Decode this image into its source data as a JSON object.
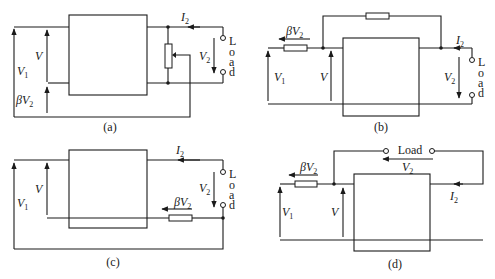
{
  "figure": {
    "panels": [
      {
        "id": "a",
        "caption": "(a)",
        "labels": {
          "I2": "I",
          "I2_sub": "2",
          "V": "V",
          "V1": "V",
          "V1_sub": "1",
          "V2": "V",
          "V2_sub": "2",
          "beta": "β",
          "betaV": "V",
          "betaV_sub": "2"
        },
        "load": [
          "L",
          "o",
          "a",
          "d"
        ],
        "description": "Amplifier with potentiometer across output; wiper feeds series voltage-feedback βV2 in input loop"
      },
      {
        "id": "b",
        "caption": "(b)",
        "labels": {
          "I2": "I",
          "I2_sub": "2",
          "V": "V",
          "V1": "V",
          "V1_sub": "1",
          "V2": "V",
          "V2_sub": "2",
          "beta": "β",
          "betaV": "V",
          "betaV_sub": "2"
        },
        "load": [
          "L",
          "o",
          "a",
          "d"
        ],
        "description": "Shunt voltage feedback: resistor from output node back to input node; series input resistor carries βV2"
      },
      {
        "id": "c",
        "caption": "(c)",
        "labels": {
          "I2": "I",
          "I2_sub": "2",
          "V": "V",
          "V1": "V",
          "V1_sub": "1",
          "V2": "V",
          "V2_sub": "2",
          "beta": "β",
          "betaV": "V",
          "betaV_sub": "2"
        },
        "load": [
          "L",
          "o",
          "a",
          "d"
        ],
        "description": "Series current feedback: resistor in output return path develops βV2 in input loop"
      },
      {
        "id": "d",
        "caption": "(d)",
        "labels": {
          "I2": "I",
          "I2_sub": "2",
          "V": "V",
          "V1": "V",
          "V1_sub": "1",
          "V2": "V",
          "V2_sub": "2",
          "beta": "β",
          "betaV": "V",
          "betaV_sub": "2",
          "load": "Load"
        },
        "description": "Shunt current feedback: load connected between output and input node"
      }
    ]
  }
}
